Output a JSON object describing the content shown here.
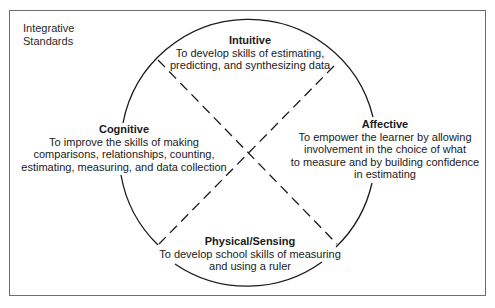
{
  "figure": {
    "corner_title": [
      "Integrative",
      "Standards"
    ],
    "quadrants": {
      "intuitive": {
        "title": "Intuitive",
        "lines": [
          "To develop skills of estimating,",
          "predicting, and synthesizing data"
        ]
      },
      "cognitive": {
        "title": "Cognitive",
        "lines": [
          "To improve the skills of making",
          "comparisons, relationships, counting,",
          "estimating, measuring, and data collection"
        ]
      },
      "affective": {
        "title": "Affective",
        "lines": [
          "To empower the learner by allowing",
          "involvement in the choice of what",
          "to measure and by building confidence",
          "in estimating"
        ]
      },
      "physical": {
        "title": "Physical/Sensing",
        "lines": [
          "To develop school skills of measuring",
          "and using a ruler"
        ]
      }
    },
    "colors": {
      "stroke": "#1a1a1a",
      "frame": "#6e6e6e",
      "text": "#1a1a1a",
      "background": "#ffffff"
    }
  }
}
